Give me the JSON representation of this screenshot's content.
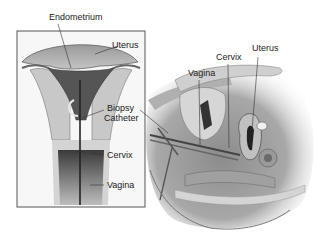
{
  "figure": {
    "inset": {
      "labels": {
        "endometrium": "Endometrium",
        "uterus": "Uterus",
        "biopsy_catheter_line1": "Biopsy",
        "biopsy_catheter_line2": "Catheter",
        "cervix": "Cervix",
        "vagina": "Vagina"
      }
    },
    "sagittal": {
      "labels": {
        "vagina": "Vagina",
        "cervix": "Cervix",
        "uterus": "Uterus"
      }
    },
    "colors": {
      "background": "#ffffff",
      "frame": "#555555",
      "tissue_light": "#c8c8c8",
      "tissue_mid": "#8a8a8a",
      "tissue_dark": "#3c3c3c",
      "leader_line": "#333333"
    }
  }
}
